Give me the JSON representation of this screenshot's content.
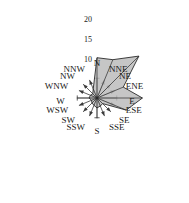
{
  "chart_data": {
    "type": "radar",
    "chart_subtype": "wind-rose",
    "title": "",
    "xlabel": "",
    "ylabel": "",
    "grid": false,
    "legend": null,
    "legend_position": "none",
    "radial_axis": {
      "label": "",
      "ticks": [
        5,
        10,
        15,
        20
      ],
      "tick_labels": [
        "",
        "10",
        "15",
        "20"
      ],
      "visible_tick_labels": [
        "10",
        "15",
        "20"
      ],
      "rmin": 0,
      "rmax": 20,
      "units": ""
    },
    "categories": [
      "N",
      "NNE",
      "NE",
      "ENE",
      "E",
      "ESE",
      "SE",
      "SSE",
      "S",
      "SSW",
      "SW",
      "WSW",
      "W",
      "WNW",
      "NW",
      "NNW"
    ],
    "values": [
      10.2,
      10.5,
      15.0,
      7.2,
      11.5,
      8.0,
      2.0,
      2.2,
      2.5,
      2.0,
      1.8,
      1.5,
      2.0,
      1.8,
      1.5,
      2.5
    ],
    "series": [
      {
        "name": "frequency",
        "values": [
          10.2,
          10.5,
          15.0,
          7.2,
          11.5,
          8.0,
          2.0,
          2.2,
          2.5,
          2.0,
          1.8,
          1.5,
          2.0,
          1.8,
          1.5,
          2.5
        ]
      }
    ],
    "fill_color": "#b9b9b9",
    "line_color": "#2a2a2a"
  },
  "axes": {
    "direction_labels": [
      {
        "name": "N",
        "text": "N",
        "angle_deg": 0
      },
      {
        "name": "NNE",
        "text": "NNE",
        "angle_deg": 22.5
      },
      {
        "name": "NE",
        "text": "NE",
        "angle_deg": 45
      },
      {
        "name": "ENE",
        "text": "ENE",
        "angle_deg": 67.5
      },
      {
        "name": "E",
        "text": "E",
        "angle_deg": 90
      },
      {
        "name": "ESE",
        "text": "ESE",
        "angle_deg": 112.5
      },
      {
        "name": "SE",
        "text": "SE",
        "angle_deg": 135
      },
      {
        "name": "SSE",
        "text": "SSE",
        "angle_deg": 157.5
      },
      {
        "name": "S",
        "text": "S",
        "angle_deg": 180
      },
      {
        "name": "SSW",
        "text": "SSW",
        "angle_deg": 202.5
      },
      {
        "name": "SW",
        "text": "SW",
        "angle_deg": 225
      },
      {
        "name": "WSW",
        "text": "WSW",
        "angle_deg": 247.5
      },
      {
        "name": "W",
        "text": "W",
        "angle_deg": 270
      },
      {
        "name": "WNW",
        "text": "WNW",
        "angle_deg": 292.5
      },
      {
        "name": "NW",
        "text": "NW",
        "angle_deg": 315
      },
      {
        "name": "NNW",
        "text": "NNW",
        "angle_deg": 337.5
      }
    ],
    "radial_ticks": [
      {
        "name": "tick-10",
        "text": "10",
        "value": 10
      },
      {
        "name": "tick-15",
        "text": "15",
        "value": 15
      },
      {
        "name": "tick-20",
        "text": "20",
        "value": 20
      }
    ]
  },
  "colors": {
    "petal_fill": "#b9b9b9",
    "petal_stroke": "#2a2a2a",
    "axis": "#3a3a3a",
    "text": "#1a1a1a",
    "background": "#ffffff"
  }
}
